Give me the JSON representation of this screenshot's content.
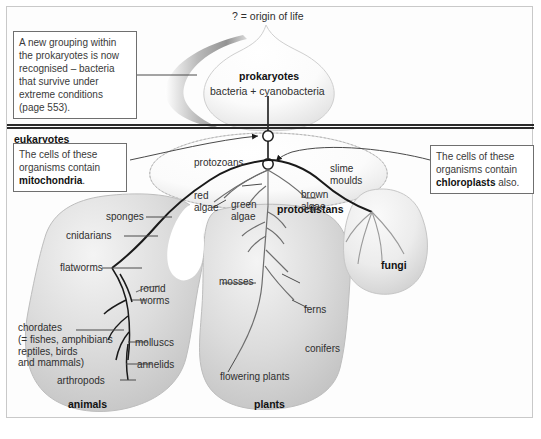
{
  "figure": {
    "origin_label": "? = origin of life",
    "divider_label": "eukaryotes"
  },
  "kingdoms": {
    "prokaryotes": {
      "title": "prokaryotes",
      "subtitle": "bacteria + cyanobacteria"
    },
    "protoctistans": {
      "title": "protoctistans"
    },
    "fungi": {
      "title": "fungi"
    },
    "animals": {
      "title": "animals"
    },
    "plants": {
      "title": "plants"
    }
  },
  "callouts": {
    "prokaryote_note": {
      "lines": [
        "A new grouping within",
        "the prokaryotes is now",
        "recognised – bacteria",
        "that survive under",
        "extreme conditions",
        "(page 553)."
      ]
    },
    "mitochondria_note": {
      "line1": "The cells of these",
      "line2": "organisms contain",
      "bold": "mitochondria",
      "tail": "."
    },
    "chloroplast_note": {
      "line1": "The cells of these",
      "line2": "organisms contain",
      "bold": "chloroplasts",
      "tail": " also."
    }
  },
  "protoctistan_groups": [
    {
      "id": "protozoans",
      "label": "protozoans"
    },
    {
      "id": "red-algae",
      "label": "red\nalgae"
    },
    {
      "id": "green-algae",
      "label": "green\nalgae"
    },
    {
      "id": "brown-algae",
      "label": "brown\nalgae"
    },
    {
      "id": "slime-moulds",
      "label": "slime\nmoulds"
    }
  ],
  "animal_groups": [
    {
      "id": "sponges",
      "label": "sponges"
    },
    {
      "id": "cnidarians",
      "label": "cnidarians"
    },
    {
      "id": "flatworms",
      "label": "flatworms"
    },
    {
      "id": "round-worms",
      "label": "round\nworms"
    },
    {
      "id": "chordates",
      "label": "chordates\n(= fishes, amphibians\nreptiles, birds\nand mammals)"
    },
    {
      "id": "molluscs",
      "label": "molluscs"
    },
    {
      "id": "annelids",
      "label": "annelids"
    },
    {
      "id": "arthropods",
      "label": "arthropods"
    }
  ],
  "plant_groups": [
    {
      "id": "mosses",
      "label": "mosses"
    },
    {
      "id": "ferns",
      "label": "ferns"
    },
    {
      "id": "conifers",
      "label": "conifers"
    },
    {
      "id": "flowering-plants",
      "label": "flowering plants"
    }
  ],
  "colors": {
    "blob_fill": "#d6d6d6",
    "blob_light": "#f2f2f2",
    "line": "#555555",
    "heavy_line": "#1a1a1a",
    "rule": "#2a2a2a"
  }
}
